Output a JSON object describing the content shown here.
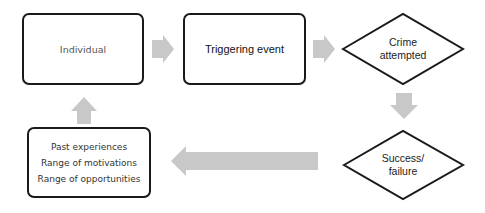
{
  "diagram": {
    "type": "flowchart",
    "nodes": {
      "individual": {
        "label": "Individual",
        "shape": "rounded-rectangle"
      },
      "triggering_event": {
        "label": "Triggering event",
        "shape": "rounded-rectangle"
      },
      "crime_attempted": {
        "label_line1": "Crime",
        "label_line2": "attempted",
        "shape": "diamond"
      },
      "success_failure": {
        "label_line1": "Success/",
        "label_line2": "failure",
        "shape": "diamond"
      },
      "feedback": {
        "shape": "rounded-rectangle",
        "lines": [
          "Past experiences",
          "Range of motivations",
          "Range of opportunities"
        ]
      }
    },
    "edges": [
      {
        "from": "individual",
        "to": "triggering_event",
        "direction": "right"
      },
      {
        "from": "triggering_event",
        "to": "crime_attempted",
        "direction": "right"
      },
      {
        "from": "crime_attempted",
        "to": "success_failure",
        "direction": "down"
      },
      {
        "from": "success_failure",
        "to": "feedback",
        "direction": "left"
      },
      {
        "from": "feedback",
        "to": "individual",
        "direction": "up"
      }
    ],
    "colors": {
      "border": "#1a1a1a",
      "arrow": "#c8c8c8",
      "background": "#ffffff"
    }
  }
}
